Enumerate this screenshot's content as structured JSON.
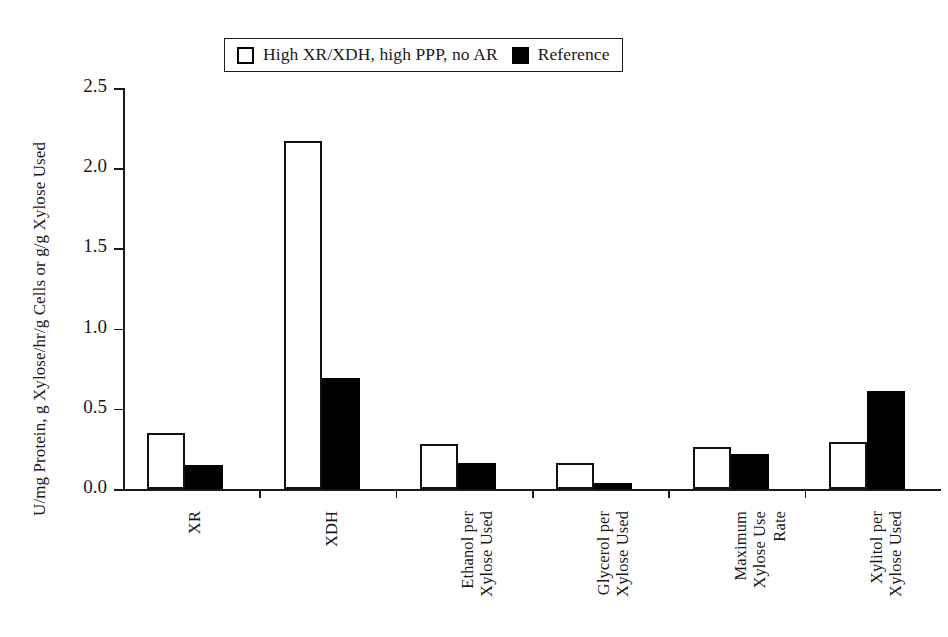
{
  "chart_data": {
    "type": "bar",
    "title": "",
    "xlabel": "",
    "ylabel": "U/mg Protein, g Xylose/hr/g Cells or g/g Xylose Used",
    "ylim": [
      0.0,
      2.5
    ],
    "ytick_labels": [
      "0.0",
      "0.5",
      "1.0",
      "1.5",
      "2.0",
      "2.5"
    ],
    "ytick_values": [
      0.0,
      0.5,
      1.0,
      1.5,
      2.0,
      2.5
    ],
    "grid": false,
    "legend_position": "top-center",
    "categories": [
      "XR",
      "XDH",
      "Ethanol per\nXylose Used",
      "Glycerol per\nXylose Used",
      "Maximum\nXylose Use\nRate",
      "Xylitol per\nXylose Used"
    ],
    "series": [
      {
        "name": "High XR/XDH, high PPP, no AR",
        "color": "#ffffff",
        "edge_color": "#111111",
        "values": [
          0.35,
          2.17,
          0.28,
          0.16,
          0.26,
          0.29
        ]
      },
      {
        "name": "Reference",
        "color": "#000000",
        "edge_color": "#000000",
        "values": [
          0.15,
          0.69,
          0.16,
          0.04,
          0.22,
          0.61
        ]
      }
    ]
  },
  "legend": {
    "entries": [
      {
        "label": "High XR/XDH, high PPP, no AR",
        "swatch": "hollow"
      },
      {
        "label": "Reference",
        "swatch": "filled"
      }
    ]
  },
  "axis": {
    "y_title": "U/mg Protein, g Xylose/hr/g Cells or g/g Xylose Used"
  }
}
